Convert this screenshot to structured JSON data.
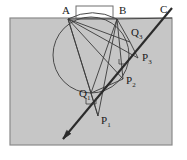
{
  "figure": {
    "type": "geometry-diagram",
    "canvas": {
      "width": 187,
      "height": 160,
      "background": "#ffffff"
    },
    "colors": {
      "region_fill": "#c6c6c6",
      "region_stroke": "#8a8a8a",
      "line_stroke": "#3a3a3a",
      "thick_line_stroke": "#2b2b2b",
      "circle_stroke": "#4a4a4a",
      "label_color": "#1a1a1a",
      "inset_fill": "#ffffff"
    },
    "region": {
      "name": "shaded-rectangle",
      "x": 10,
      "y": 18,
      "width": 162,
      "height": 127
    },
    "inset_rect": {
      "name": "white-notch-rectangle",
      "x": 76,
      "y": 6,
      "width": 37,
      "height": 12
    },
    "circle": {
      "name": "main-circle",
      "cx": 91,
      "cy": 55,
      "r": 38
    },
    "points": [
      {
        "id": "A",
        "label": "A",
        "sublabel": "",
        "x": 68,
        "y": 19,
        "label_x": 62,
        "label_y": 14
      },
      {
        "id": "B",
        "label": "B",
        "sublabel": "",
        "x": 117,
        "y": 19,
        "label_x": 119,
        "label_y": 14
      },
      {
        "id": "C",
        "label": "C",
        "sublabel": "",
        "x": 163,
        "y": 18,
        "label_x": 160,
        "label_y": 13
      },
      {
        "id": "Q3",
        "label": "Q",
        "sublabel": "3",
        "x": 130,
        "y": 42,
        "label_x": 131,
        "label_y": 36
      },
      {
        "id": "P3",
        "label": "P",
        "sublabel": "3",
        "x": 138,
        "y": 58,
        "label_x": 142,
        "label_y": 61
      },
      {
        "id": "P2",
        "label": "P",
        "sublabel": "2",
        "x": 123,
        "y": 79,
        "label_x": 126,
        "label_y": 84
      },
      {
        "id": "Q1",
        "label": "Q",
        "sublabel": "1",
        "x": 91,
        "y": 93,
        "label_x": 79,
        "label_y": 97
      },
      {
        "id": "P1",
        "label": "P",
        "sublabel": "1",
        "x": 98,
        "y": 116,
        "label_x": 101,
        "label_y": 124
      }
    ],
    "segments": [
      {
        "name": "segment-A-B",
        "x1": 68,
        "y1": 19,
        "x2": 117,
        "y2": 19
      },
      {
        "name": "segment-B-C",
        "x1": 117,
        "y1": 19,
        "x2": 172,
        "y2": 18
      },
      {
        "name": "segment-A-P1",
        "x1": 68,
        "y1": 19,
        "x2": 98,
        "y2": 116
      },
      {
        "name": "segment-A-Q1",
        "x1": 68,
        "y1": 19,
        "x2": 91,
        "y2": 93
      },
      {
        "name": "segment-A-P2",
        "x1": 68,
        "y1": 19,
        "x2": 123,
        "y2": 79
      },
      {
        "name": "segment-A-P3",
        "x1": 68,
        "y1": 19,
        "x2": 138,
        "y2": 58
      },
      {
        "name": "segment-A-Q3",
        "x1": 68,
        "y1": 19,
        "x2": 130,
        "y2": 42
      },
      {
        "name": "segment-B-P1",
        "x1": 117,
        "y1": 19,
        "x2": 98,
        "y2": 116
      },
      {
        "name": "segment-B-Q1",
        "x1": 117,
        "y1": 19,
        "x2": 91,
        "y2": 93
      },
      {
        "name": "segment-B-P2",
        "x1": 117,
        "y1": 19,
        "x2": 123,
        "y2": 79
      },
      {
        "name": "segment-Q1-P2",
        "x1": 91,
        "y1": 93,
        "x2": 123,
        "y2": 79
      },
      {
        "name": "segment-Q3-P3",
        "x1": 130,
        "y1": 42,
        "x2": 138,
        "y2": 58
      },
      {
        "name": "segment-B-Q3",
        "x1": 117,
        "y1": 19,
        "x2": 130,
        "y2": 42
      },
      {
        "name": "segment-P1-Q1",
        "x1": 98,
        "y1": 116,
        "x2": 91,
        "y2": 93
      }
    ],
    "ray": {
      "name": "transversal-ray",
      "x1": 172,
      "y1": 8,
      "x2": 63,
      "y2": 139,
      "arrow_at": "lower-left"
    },
    "right_angle_marks": [
      {
        "name": "right-angle-at-Q1",
        "x": 91,
        "y": 93
      },
      {
        "name": "right-angle-mark-upper",
        "x": 123,
        "y": 62
      }
    ]
  }
}
